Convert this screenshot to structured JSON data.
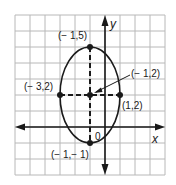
{
  "diagram": {
    "type": "ellipse-on-grid",
    "grid": {
      "cols": 10,
      "rows": 10,
      "color": "#b8b8b8"
    },
    "axes": {
      "x_label": "x",
      "y_label": "y",
      "origin_label": "0"
    },
    "ellipse": {
      "center": [
        -1,
        2
      ],
      "semi_major_vertical": 3,
      "semi_minor_horizontal": 2
    },
    "points": [
      {
        "label": "(− 1,5)",
        "x": -1,
        "y": 5
      },
      {
        "label": "(− 3,2)",
        "x": -3,
        "y": 2
      },
      {
        "label": "(− 1,2)",
        "x": -1,
        "y": 2
      },
      {
        "label": "(1,2)",
        "x": 1,
        "y": 2
      },
      {
        "label": "(− 1,− 1)",
        "x": -1,
        "y": -1
      }
    ],
    "colors": {
      "ink": "#1a1a1a",
      "grid": "#b8b8b8",
      "background": "#ffffff"
    }
  }
}
